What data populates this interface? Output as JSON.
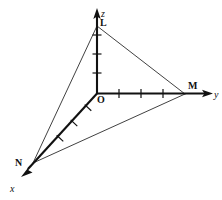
{
  "figure": {
    "type": "3d-coordinate-axes-diagram",
    "background_color": "#ffffff",
    "line_color": "#111111",
    "width": 222,
    "height": 200,
    "axis_labels": {
      "x": "x",
      "y": "y",
      "z": "z"
    },
    "point_labels": {
      "origin": "O",
      "on_z_axis": "L",
      "on_y_axis": "M",
      "on_x_axis": "N"
    },
    "points": {
      "O": {
        "label": "O",
        "px": [
          97,
          93
        ]
      },
      "L": {
        "label": "L",
        "px": [
          97,
          26
        ]
      },
      "M": {
        "label": "M",
        "px": [
          185,
          94
        ]
      },
      "N": {
        "label": "N",
        "px": [
          33,
          163
        ]
      }
    },
    "axes": {
      "z": {
        "from": [
          97,
          93
        ],
        "to": [
          97,
          26
        ],
        "arrow_tip": [
          97,
          9
        ],
        "tick_count": 2
      },
      "y": {
        "from": [
          97,
          93
        ],
        "to": [
          185,
          94
        ],
        "arrow_tip": [
          213,
          94
        ],
        "tick_count": 3
      },
      "x": {
        "from": [
          97,
          93
        ],
        "to": [
          33,
          163
        ],
        "arrow_tip": [
          22,
          179
        ],
        "tick_count": 3
      }
    },
    "triangle_edges": [
      {
        "name": "L-M",
        "from": [
          97,
          26
        ],
        "to": [
          185,
          94
        ]
      },
      {
        "name": "L-N",
        "from": [
          97,
          26
        ],
        "to": [
          33,
          163
        ]
      },
      {
        "name": "N-M",
        "from": [
          33,
          163
        ],
        "to": [
          185,
          94
        ]
      }
    ]
  }
}
